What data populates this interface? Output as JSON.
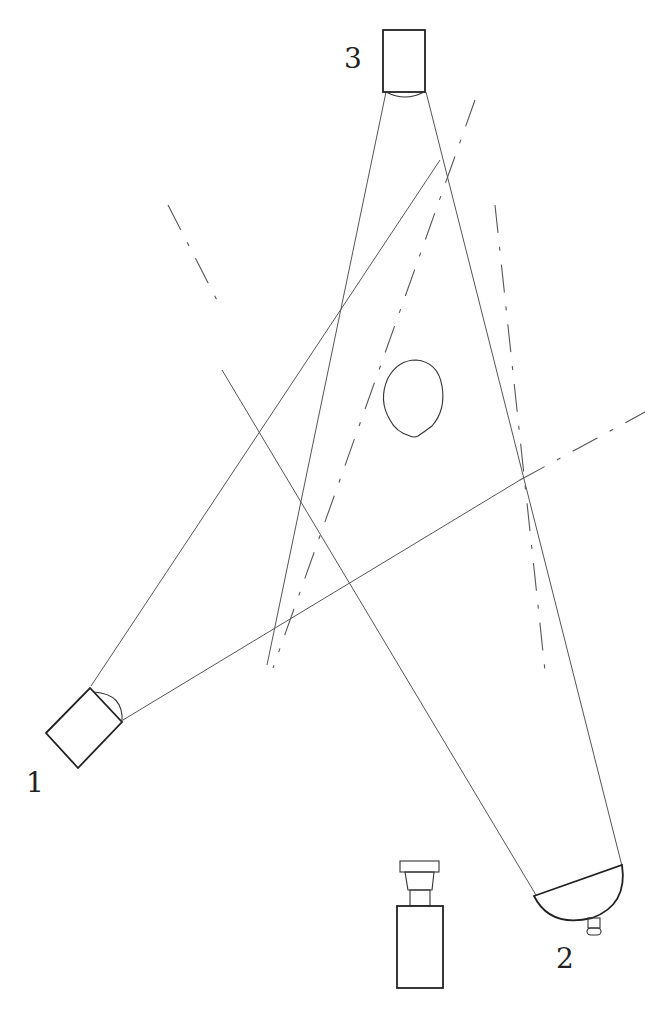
{
  "diagram": {
    "type": "lighting setup diagram",
    "labels": {
      "light_1": "1",
      "light_2": "2",
      "light_3": "3"
    },
    "elements": [
      {
        "id": "light_1",
        "shape": "rectangular lamp with lens",
        "position": "lower-left"
      },
      {
        "id": "light_2",
        "shape": "bowl reflector with bulb",
        "position": "lower-right"
      },
      {
        "id": "light_3",
        "shape": "rectangular lamp with lens",
        "position": "top-center"
      },
      {
        "id": "subject",
        "shape": "head outline (oval)",
        "position": "center"
      },
      {
        "id": "camera",
        "shape": "camera body with lens",
        "position": "bottom-center"
      }
    ],
    "line_color": "#555555",
    "background": "#ffffff"
  }
}
